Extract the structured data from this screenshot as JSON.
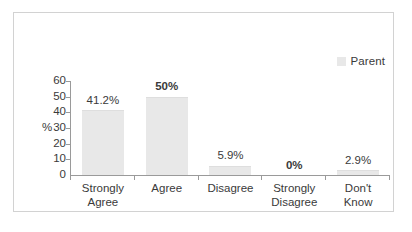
{
  "chart_data": {
    "type": "bar",
    "title": "",
    "subtitle": "",
    "xlabel": "",
    "ylabel": "%",
    "categories": [
      "Strongly Agree",
      "Agree",
      "Disagree",
      "Strongly Disagree",
      "Don't Know"
    ],
    "category_lines": [
      [
        "Strongly",
        "Agree"
      ],
      [
        "Agree",
        ""
      ],
      [
        "Disagree",
        ""
      ],
      [
        "Strongly",
        "Disagree"
      ],
      [
        "Don't",
        "Know"
      ]
    ],
    "values": [
      41.2,
      50,
      5.9,
      0,
      2.9
    ],
    "data_labels": [
      "41.2%",
      "50%",
      "5.9%",
      "0%",
      "2.9%"
    ],
    "data_label_bold": [
      false,
      true,
      false,
      true,
      false
    ],
    "series": [
      {
        "name": "Parent",
        "values": [
          41.2,
          50,
          5.9,
          0,
          2.9
        ],
        "color": "#e8e8e8"
      }
    ],
    "ylim": [
      0,
      60
    ],
    "yticks": [
      60,
      50,
      40,
      30,
      20,
      10,
      0
    ],
    "ytick_labels": [
      "60",
      "50",
      "40",
      "30",
      "20",
      "10",
      "0"
    ],
    "grid": false,
    "legend": {
      "position": "top-right",
      "entries": [
        {
          "label": "Parent",
          "color": "#e8e8e8"
        }
      ]
    },
    "colors": {
      "bar": "#e8e8e8",
      "axis": "#9a9a9a",
      "text": "#3a3a3a",
      "frame": "#d2d2d2",
      "background": "#ffffff"
    }
  }
}
